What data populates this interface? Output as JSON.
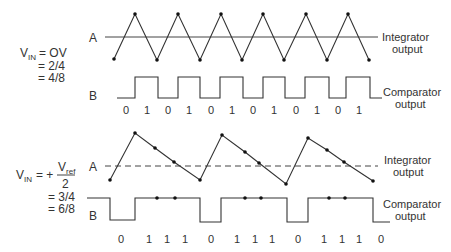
{
  "top_panel": {
    "vin_label": "V",
    "vin_sub": "IN",
    "vin_eq": "= OV",
    "ratio1": "= 2/4",
    "ratio2": "= 4/8",
    "trace_a_label": "A",
    "trace_b_label": "B",
    "integrator_label_line1": "Integrator",
    "integrator_label_line2": "output",
    "comparator_label_line1": "Comparator",
    "comparator_label_line2": "output",
    "bits": [
      "0",
      "1",
      "0",
      "1",
      "0",
      "1",
      "0",
      "1",
      "0",
      "1",
      "0",
      "1"
    ]
  },
  "bottom_panel": {
    "vin_label": "V",
    "vin_sub": "IN",
    "vin_eq": "= +",
    "vref_label": "V",
    "vref_sub": "ref",
    "vref_den": "2",
    "ratio1": "= 3/4",
    "ratio2": "= 6/8",
    "trace_a_label": "A",
    "trace_b_label": "B",
    "integrator_label_line1": "Integrator",
    "integrator_label_line2": "output",
    "comparator_label_line1": "Comparator",
    "comparator_label_line2": "output",
    "bits": [
      "0",
      "1",
      "1",
      "1",
      "0",
      "1",
      "1",
      "1",
      "0",
      "1",
      "1",
      "1",
      "0"
    ]
  }
}
